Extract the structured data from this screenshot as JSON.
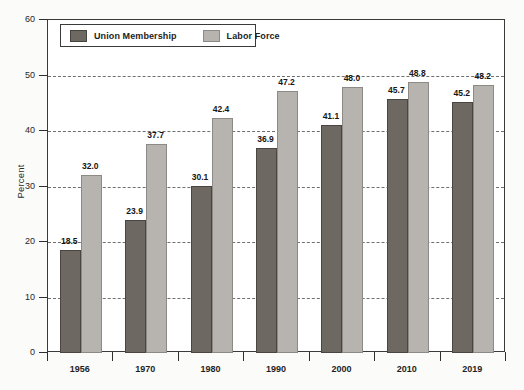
{
  "chart_data": {
    "type": "bar",
    "title": "",
    "xlabel": "",
    "ylabel": "Percent",
    "ylim": [
      0,
      60
    ],
    "yticks": [
      0,
      10,
      20,
      30,
      40,
      50,
      60
    ],
    "grid": true,
    "grid_style": "dashed-horizontal",
    "legend_position": "top-left-inside",
    "categories": [
      "1956",
      "1970",
      "1980",
      "1990",
      "2000",
      "2010",
      "2019"
    ],
    "series": [
      {
        "name": "Union Membership",
        "color": "#6e6862",
        "values": [
          18.5,
          23.9,
          30.1,
          36.9,
          41.1,
          45.7,
          45.2
        ],
        "labels": [
          "18.5",
          "23.9",
          "30.1",
          "36.9",
          "41.1",
          "45.7",
          "45.2"
        ]
      },
      {
        "name": "Labor Force",
        "color": "#b7b4af",
        "values": [
          32.0,
          37.7,
          42.4,
          47.2,
          48.0,
          48.8,
          48.2
        ],
        "labels": [
          "32.0",
          "37.7",
          "42.4",
          "47.2",
          "48.0",
          "48.8",
          "48.2"
        ]
      }
    ],
    "ytick_labels": [
      "0",
      "10",
      "20",
      "30",
      "40",
      "50",
      "60"
    ]
  },
  "axis": {
    "y_title": "Percent"
  },
  "legend": {
    "items": [
      {
        "label": "Union Membership",
        "swatch": "union"
      },
      {
        "label": "Labor Force",
        "swatch": "labor"
      }
    ]
  }
}
